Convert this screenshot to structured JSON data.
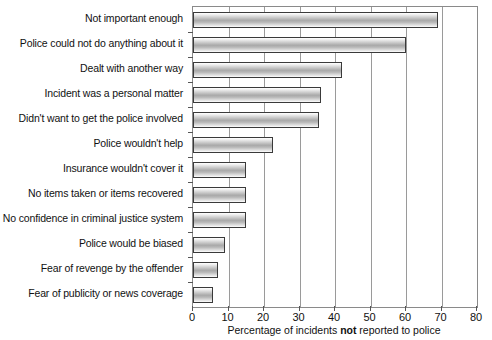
{
  "chart_data": {
    "type": "bar",
    "orientation": "horizontal",
    "title": "",
    "xlabel_prefix": "Percentage of incidents ",
    "xlabel_bold": "not",
    "xlabel_suffix": " reported to police",
    "xlabel": "Percentage of incidents not reported to police",
    "ylabel": "",
    "xlim": [
      0,
      80
    ],
    "xticks": [
      0,
      10,
      20,
      30,
      40,
      50,
      60,
      70,
      80
    ],
    "grid": "vertical",
    "legend": "none",
    "categories": [
      "Not important enough",
      "Police could not do anything about it",
      "Dealt with another way",
      "Incident was a personal matter",
      "Didn't want to get the police involved",
      "Police wouldn't help",
      "Insurance wouldn't cover it",
      "No items taken or items recovered",
      "No confidence in criminal justice system",
      "Police would be biased",
      "Fear of revenge by the offender",
      "Fear of publicity or news coverage"
    ],
    "values": [
      69,
      60,
      42,
      36,
      35.5,
      22.5,
      15,
      15,
      15,
      9,
      7,
      5.5
    ],
    "colors": {
      "bar_outline": "#3a3a3a",
      "bar_fill_light": "#ffffff",
      "bar_fill_dark": "#a9a9a9",
      "frame": "#8a8a8a",
      "gridline": "#9a9a9a",
      "text": "#111111"
    }
  }
}
